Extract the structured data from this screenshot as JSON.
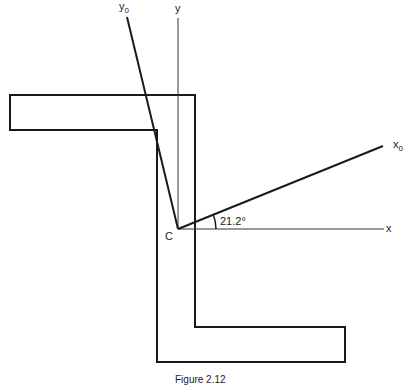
{
  "diagram": {
    "type": "Z-section with principal axes",
    "labels": {
      "y0_axis": "y",
      "y0_sub": "0",
      "y_axis": "y",
      "x0_axis": "x",
      "x0_sub": "0",
      "x_axis": "x",
      "centroid": "C",
      "angle": "21.2°"
    },
    "caption": "Figure 2.12",
    "colors": {
      "line": "#1a1a1a",
      "background": "#ffffff"
    }
  }
}
